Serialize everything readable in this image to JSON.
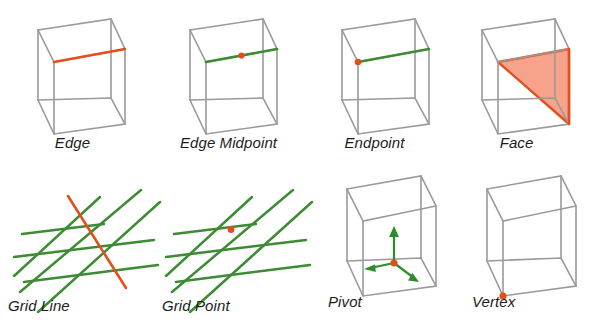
{
  "figure": {
    "background": "#ffffff",
    "colors": {
      "wireframe": "#9a9a9a",
      "highlight_orange": "#e24f1c",
      "highlight_green": "#3d8b33",
      "face_fill": "#f4806099",
      "label": "#1b1b1b"
    }
  },
  "panels": [
    {
      "id": "edge",
      "label": "Edge",
      "art": "cube",
      "highlight_type": "edge-orange",
      "highlight_color": "#e24f1c",
      "marker": "none"
    },
    {
      "id": "edge-midpoint",
      "label": "Edge Midpoint",
      "art": "cube",
      "highlight_type": "edge-green",
      "highlight_color": "#3d8b33",
      "marker": "midpoint-dot",
      "marker_color": "#e24f1c"
    },
    {
      "id": "endpoint",
      "label": "Endpoint",
      "art": "cube",
      "highlight_type": "edge-green",
      "highlight_color": "#3d8b33",
      "marker": "endpoint-dot",
      "marker_color": "#e24f1c"
    },
    {
      "id": "face",
      "label": "Face",
      "art": "cube",
      "highlight_type": "face-triangle",
      "highlight_color": "#e24f1c",
      "marker": "none"
    },
    {
      "id": "grid-line",
      "label": "Grid Line",
      "art": "grid",
      "highlight_type": "grid-line-orange",
      "highlight_color": "#e24f1c",
      "marker": "none"
    },
    {
      "id": "grid-point",
      "label": "Grid Point",
      "art": "grid",
      "highlight_type": "none",
      "highlight_color": "#3d8b33",
      "marker": "intersection-dot",
      "marker_color": "#e24f1c"
    },
    {
      "id": "pivot",
      "label": "Pivot",
      "art": "cube",
      "highlight_type": "axis-gizmo",
      "highlight_color": "#2e8b2e",
      "marker": "center-dot",
      "marker_color": "#e24f1c"
    },
    {
      "id": "vertex",
      "label": "Vertex",
      "art": "cube",
      "highlight_type": "none",
      "highlight_color": "#9a9a9a",
      "marker": "corner-dot",
      "marker_color": "#e24f1c"
    }
  ]
}
